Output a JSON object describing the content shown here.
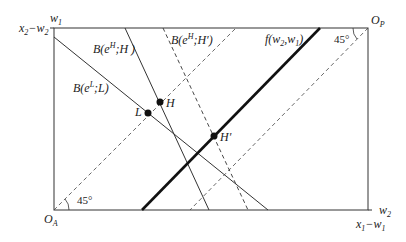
{
  "diagram": {
    "type": "box-diagram",
    "origins": {
      "left_bottom": "O_A",
      "right_top": "O_P"
    },
    "axis_labels": {
      "left_top": "w1",
      "left_top_tick": "x2−w2",
      "right_bottom": "w2",
      "right_bottom_tick": "x1−w1"
    },
    "curves": [
      {
        "id": "BL",
        "label": "B(e^L;L)",
        "style": "solid"
      },
      {
        "id": "BH",
        "label": "B(e^H;H)",
        "style": "solid"
      },
      {
        "id": "BHp",
        "label": "B(e^H;H′)",
        "style": "dashed"
      },
      {
        "id": "f",
        "label": "f(w2,w1)",
        "style": "thick"
      },
      {
        "id": "ray_A",
        "label": "45° ray from O_A",
        "style": "dashed"
      },
      {
        "id": "ray_P",
        "label": "45° ray from O_P",
        "style": "dashed"
      }
    ],
    "points": [
      "L",
      "H",
      "H′"
    ],
    "angles": [
      "45°",
      "45°"
    ]
  },
  "labels": {
    "w1_main": "w",
    "w1_sub": "1",
    "x2w2_a": "x",
    "x2w2_a_sub": "2",
    "x2w2_b": "−w",
    "x2w2_b_sub": "2",
    "BH_pre": "B(e",
    "BH_sup": "H",
    "BH_post": ";H )",
    "BHp_pre": "B(e",
    "BHp_sup": "H",
    "BHp_post": ";H′)",
    "BL_pre": "B(e",
    "BL_sup": "L",
    "BL_post": ";L)",
    "f_pre": "f(w",
    "f_s1": "2",
    "f_mid": ",w",
    "f_s2": "1",
    "f_post": ")",
    "OP_main": "O",
    "OP_sub": "P",
    "OA_main": "O",
    "OA_sub": "A",
    "angle_top": "45°",
    "angle_bottom": "45°",
    "pt_L": "L",
    "pt_H": "H",
    "pt_Hp": "H′",
    "w2_main": "w",
    "w2_sub": "2",
    "x1w1_a": "x",
    "x1w1_a_sub": "1",
    "x1w1_b": "−w",
    "x1w1_b_sub": "1"
  }
}
